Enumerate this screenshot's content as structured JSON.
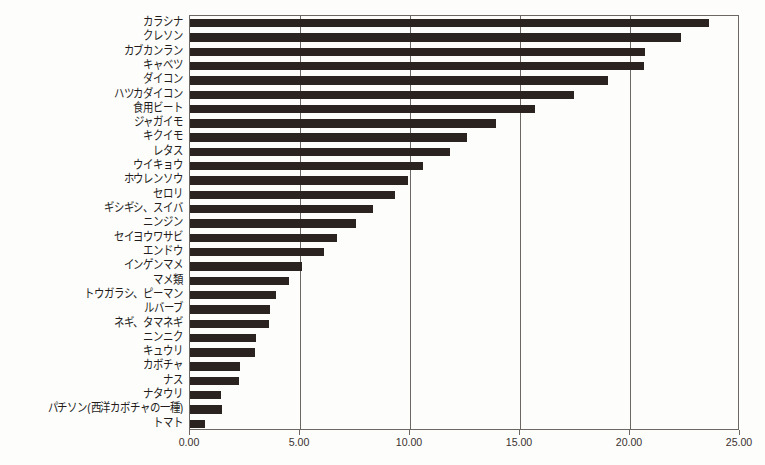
{
  "chart_data": {
    "type": "bar",
    "orientation": "horizontal",
    "title": "",
    "subtitle": "",
    "xlabel": "",
    "ylabel": "",
    "xlim": [
      0,
      25
    ],
    "xticks": [
      0,
      5,
      10,
      15,
      20,
      25
    ],
    "xtick_labels": [
      "0.00",
      "5.00",
      "10.00",
      "15.00",
      "20.00",
      "25.00"
    ],
    "grid": "vertical",
    "legend": "none",
    "bar_color": "#2b2320",
    "background_color": "#fdfdfb",
    "axis_color": "#6d6763",
    "sorted": "descending",
    "categories": [
      "カラシナ",
      "クレソン",
      "カブカンラン",
      "キャベツ",
      "ダイコン",
      "ハツカダイコン",
      "食用ビート",
      "ジャガイモ",
      "キクイモ",
      "レタス",
      "ウイキョウ",
      "ホウレンソウ",
      "セロリ",
      "ギシギシ、スイバ",
      "ニンジン",
      "セイヨウワサビ",
      "エンドウ",
      "インゲンマメ",
      "マメ類",
      "トウガラシ、ピーマン",
      "ルバーブ",
      "ネギ、タマネギ",
      "ニンニク",
      "キュウリ",
      "カボチャ",
      "ナス",
      "ナタウリ",
      "パチソン(西洋カボチャの一種)",
      "トマト"
    ],
    "values": [
      23.6,
      22.3,
      20.7,
      20.65,
      19.0,
      17.45,
      15.7,
      13.9,
      12.6,
      11.8,
      10.6,
      9.9,
      9.3,
      8.3,
      7.55,
      6.7,
      6.1,
      5.07,
      4.5,
      3.9,
      3.62,
      3.58,
      2.98,
      2.95,
      2.26,
      2.22,
      1.4,
      1.44,
      0.66
    ]
  }
}
